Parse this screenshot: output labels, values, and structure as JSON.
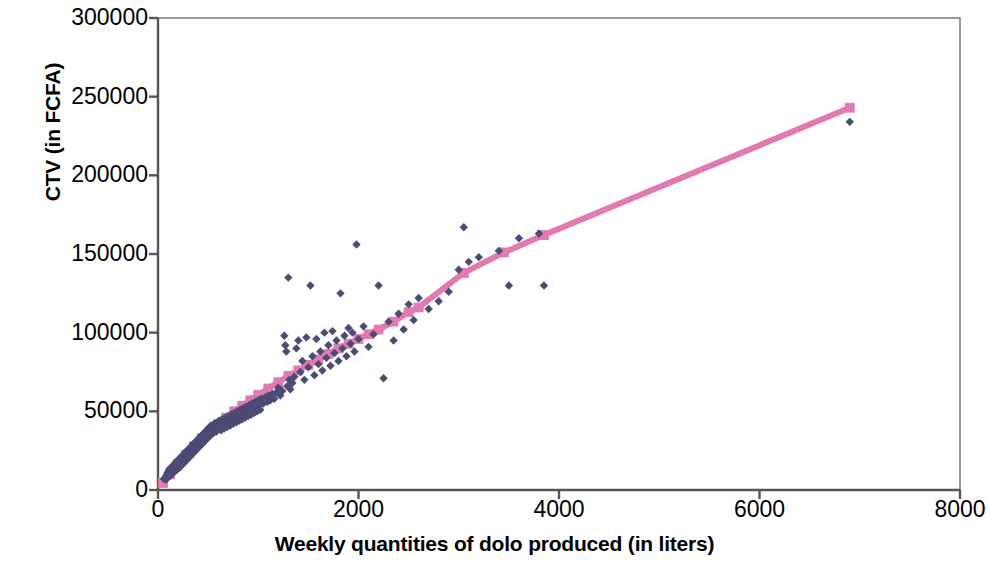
{
  "chart_data": {
    "type": "scatter",
    "title": "",
    "xlabel": "Weekly quantities of dolo produced (in liters)",
    "ylabel": "CTV (in FCFA)",
    "xlim": [
      0,
      8000
    ],
    "ylim": [
      0,
      300000
    ],
    "xticks": [
      0,
      2000,
      4000,
      6000,
      8000
    ],
    "yticks": [
      0,
      50000,
      100000,
      150000,
      200000,
      250000,
      300000
    ],
    "xtick_labels": [
      "0",
      "2000",
      "4000",
      "6000",
      "8000"
    ],
    "ytick_labels": [
      "0",
      "50000",
      "100000",
      "150000",
      "200000",
      "250000",
      "300000"
    ],
    "grid": false,
    "legend": "none",
    "series": [
      {
        "name": "Observed CTV",
        "type": "scatter",
        "marker": "diamond",
        "color": "#4b4b75",
        "points": [
          [
            60,
            7000
          ],
          [
            70,
            8000
          ],
          [
            80,
            6500
          ],
          [
            85,
            9500
          ],
          [
            90,
            8000
          ],
          [
            95,
            11000
          ],
          [
            100,
            9000
          ],
          [
            105,
            12000
          ],
          [
            110,
            10000
          ],
          [
            115,
            13500
          ],
          [
            120,
            11000
          ],
          [
            125,
            9000
          ],
          [
            130,
            14000
          ],
          [
            135,
            12500
          ],
          [
            140,
            10500
          ],
          [
            145,
            15000
          ],
          [
            150,
            12000
          ],
          [
            155,
            16000
          ],
          [
            160,
            13000
          ],
          [
            165,
            11500
          ],
          [
            170,
            17000
          ],
          [
            175,
            14000
          ],
          [
            180,
            12500
          ],
          [
            185,
            18000
          ],
          [
            190,
            15000
          ],
          [
            195,
            13500
          ],
          [
            200,
            19000
          ],
          [
            205,
            16000
          ],
          [
            210,
            14000
          ],
          [
            215,
            20000
          ],
          [
            220,
            17000
          ],
          [
            225,
            15000
          ],
          [
            230,
            21000
          ],
          [
            235,
            18000
          ],
          [
            240,
            16000
          ],
          [
            245,
            22000
          ],
          [
            250,
            19000
          ],
          [
            255,
            17000
          ],
          [
            260,
            23000
          ],
          [
            265,
            20000
          ],
          [
            270,
            18000
          ],
          [
            275,
            24000
          ],
          [
            280,
            21000
          ],
          [
            285,
            19000
          ],
          [
            290,
            25000
          ],
          [
            295,
            22000
          ],
          [
            300,
            20000
          ],
          [
            305,
            26000
          ],
          [
            310,
            23000
          ],
          [
            315,
            21000
          ],
          [
            320,
            27000
          ],
          [
            325,
            24000
          ],
          [
            330,
            22000
          ],
          [
            335,
            28000
          ],
          [
            340,
            25000
          ],
          [
            345,
            23000
          ],
          [
            350,
            29000
          ],
          [
            355,
            26000
          ],
          [
            360,
            24000
          ],
          [
            365,
            30000
          ],
          [
            370,
            27000
          ],
          [
            375,
            25000
          ],
          [
            380,
            31000
          ],
          [
            385,
            28000
          ],
          [
            390,
            26000
          ],
          [
            395,
            32000
          ],
          [
            400,
            29000
          ],
          [
            405,
            27000
          ],
          [
            410,
            33000
          ],
          [
            415,
            30000
          ],
          [
            420,
            28000
          ],
          [
            425,
            34000
          ],
          [
            430,
            31000
          ],
          [
            435,
            29000
          ],
          [
            440,
            35000
          ],
          [
            445,
            32000
          ],
          [
            450,
            30000
          ],
          [
            455,
            36000
          ],
          [
            460,
            33000
          ],
          [
            465,
            31000
          ],
          [
            470,
            37000
          ],
          [
            475,
            34000
          ],
          [
            480,
            32000
          ],
          [
            485,
            38000
          ],
          [
            490,
            35000
          ],
          [
            495,
            33000
          ],
          [
            500,
            39000
          ],
          [
            505,
            36000
          ],
          [
            510,
            34000
          ],
          [
            515,
            40000
          ],
          [
            520,
            37000
          ],
          [
            525,
            35000
          ],
          [
            530,
            41000
          ],
          [
            540,
            38000
          ],
          [
            550,
            36000
          ],
          [
            560,
            42000
          ],
          [
            570,
            39000
          ],
          [
            580,
            37000
          ],
          [
            590,
            43000
          ],
          [
            600,
            40000
          ],
          [
            610,
            44000
          ],
          [
            620,
            41000
          ],
          [
            630,
            38000
          ],
          [
            640,
            45000
          ],
          [
            650,
            42000
          ],
          [
            660,
            39000
          ],
          [
            670,
            46000
          ],
          [
            680,
            43000
          ],
          [
            690,
            40000
          ],
          [
            700,
            47000
          ],
          [
            710,
            44000
          ],
          [
            720,
            41000
          ],
          [
            730,
            48000
          ],
          [
            740,
            45000
          ],
          [
            750,
            42000
          ],
          [
            760,
            49000
          ],
          [
            770,
            46000
          ],
          [
            780,
            43000
          ],
          [
            790,
            50000
          ],
          [
            800,
            47000
          ],
          [
            810,
            44000
          ],
          [
            820,
            51000
          ],
          [
            830,
            48000
          ],
          [
            840,
            45000
          ],
          [
            850,
            52000
          ],
          [
            860,
            49000
          ],
          [
            870,
            46000
          ],
          [
            880,
            53000
          ],
          [
            890,
            50000
          ],
          [
            900,
            47000
          ],
          [
            910,
            54000
          ],
          [
            920,
            51000
          ],
          [
            930,
            48000
          ],
          [
            940,
            55000
          ],
          [
            950,
            52000
          ],
          [
            960,
            49000
          ],
          [
            970,
            56000
          ],
          [
            980,
            53000
          ],
          [
            990,
            50000
          ],
          [
            1000,
            57000
          ],
          [
            1010,
            54000
          ],
          [
            1020,
            51000
          ],
          [
            1030,
            58000
          ],
          [
            1050,
            55000
          ],
          [
            1070,
            59000
          ],
          [
            1090,
            56000
          ],
          [
            1100,
            60000
          ],
          [
            1120,
            57000
          ],
          [
            1140,
            61000
          ],
          [
            1160,
            58000
          ],
          [
            1180,
            62000
          ],
          [
            1200,
            65000
          ],
          [
            1220,
            60000
          ],
          [
            1240,
            63000
          ],
          [
            1260,
            98000
          ],
          [
            1270,
            92000
          ],
          [
            1280,
            88000
          ],
          [
            1290,
            66000
          ],
          [
            1300,
            135000
          ],
          [
            1310,
            70000
          ],
          [
            1320,
            64000
          ],
          [
            1340,
            68000
          ],
          [
            1360,
            72000
          ],
          [
            1380,
            90000
          ],
          [
            1400,
            95000
          ],
          [
            1420,
            75000
          ],
          [
            1440,
            82000
          ],
          [
            1460,
            70000
          ],
          [
            1480,
            97000
          ],
          [
            1500,
            78000
          ],
          [
            1520,
            130000
          ],
          [
            1540,
            85000
          ],
          [
            1560,
            73000
          ],
          [
            1580,
            96000
          ],
          [
            1600,
            80000
          ],
          [
            1620,
            88000
          ],
          [
            1640,
            76000
          ],
          [
            1660,
            100000
          ],
          [
            1680,
            84000
          ],
          [
            1700,
            92000
          ],
          [
            1720,
            79000
          ],
          [
            1740,
            101000
          ],
          [
            1760,
            87000
          ],
          [
            1780,
            95000
          ],
          [
            1800,
            82000
          ],
          [
            1820,
            125000
          ],
          [
            1840,
            90000
          ],
          [
            1860,
            98000
          ],
          [
            1880,
            85000
          ],
          [
            1900,
            103000
          ],
          [
            1920,
            93000
          ],
          [
            1940,
            100000
          ],
          [
            1960,
            88000
          ],
          [
            1980,
            156000
          ],
          [
            2000,
            96000
          ],
          [
            2050,
            104000
          ],
          [
            2100,
            91000
          ],
          [
            2150,
            99000
          ],
          [
            2200,
            130000
          ],
          [
            2250,
            71000
          ],
          [
            2300,
            107000
          ],
          [
            2350,
            95000
          ],
          [
            2400,
            112000
          ],
          [
            2450,
            102000
          ],
          [
            2500,
            118000
          ],
          [
            2550,
            108000
          ],
          [
            2600,
            122000
          ],
          [
            2700,
            115000
          ],
          [
            2800,
            120000
          ],
          [
            2900,
            126000
          ],
          [
            3000,
            140000
          ],
          [
            3050,
            167000
          ],
          [
            3100,
            145000
          ],
          [
            3200,
            148000
          ],
          [
            3400,
            152000
          ],
          [
            3500,
            130000
          ],
          [
            3600,
            160000
          ],
          [
            3800,
            163000
          ],
          [
            3850,
            130000
          ],
          [
            6900,
            234000
          ]
        ]
      },
      {
        "name": "Fitted CTV",
        "type": "line",
        "marker": "square",
        "color": "#e07ab0",
        "points": [
          [
            50,
            4500
          ],
          [
            120,
            10000
          ],
          [
            200,
            16500
          ],
          [
            280,
            22500
          ],
          [
            360,
            28000
          ],
          [
            440,
            33000
          ],
          [
            520,
            37500
          ],
          [
            600,
            42000
          ],
          [
            680,
            46000
          ],
          [
            760,
            50000
          ],
          [
            840,
            53500
          ],
          [
            920,
            57000
          ],
          [
            1000,
            60500
          ],
          [
            1100,
            64500
          ],
          [
            1200,
            68500
          ],
          [
            1300,
            72500
          ],
          [
            1400,
            76000
          ],
          [
            1500,
            79500
          ],
          [
            1600,
            83000
          ],
          [
            1700,
            86500
          ],
          [
            1800,
            90000
          ],
          [
            1900,
            93000
          ],
          [
            2000,
            96000
          ],
          [
            2100,
            99000
          ],
          [
            2200,
            102000
          ],
          [
            2350,
            107000
          ],
          [
            2500,
            113000
          ],
          [
            2600,
            116000
          ],
          [
            3050,
            138000
          ],
          [
            3450,
            151000
          ],
          [
            3850,
            162000
          ],
          [
            6900,
            243000
          ]
        ]
      }
    ]
  },
  "axes": {
    "plot_left_px": 158,
    "plot_right_px": 960,
    "plot_top_px": 18,
    "plot_bottom_px": 490,
    "frame_color": "#808080"
  }
}
